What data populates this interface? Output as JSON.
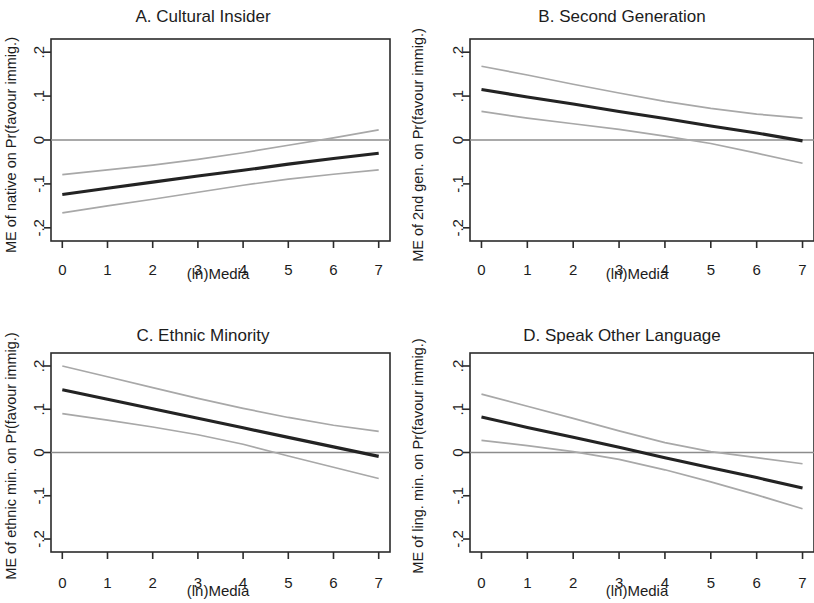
{
  "figure": {
    "background_color": "#ffffff",
    "me_line_color": "#232323",
    "ci_line_color": "#a8a8a8",
    "zero_line_color": "#8c8c8c",
    "axis_color": "#2b2b2b"
  },
  "panels": {
    "a": {
      "title": "A. Cultural Insider",
      "xlabel": "(ln)Media",
      "ylabel": "ME of native on Pr(favour immig.)",
      "xticks": [
        "0",
        "1",
        "2",
        "3",
        "4",
        "5",
        "6",
        "7"
      ],
      "yticks": [
        "-.2",
        "-.1",
        "0",
        ".1",
        ".2"
      ]
    },
    "b": {
      "title": "B. Second Generation",
      "xlabel": "(ln)Media",
      "ylabel": "ME of 2nd gen. on Pr(favour immig.)",
      "xticks": [
        "0",
        "1",
        "2",
        "3",
        "4",
        "5",
        "6",
        "7"
      ],
      "yticks": [
        "-.2",
        "-.1",
        "0",
        ".1",
        ".2"
      ]
    },
    "c": {
      "title": "C. Ethnic Minority",
      "xlabel": "(ln)Media",
      "ylabel": "ME of ethnic min. on Pr(favour immig.)",
      "xticks": [
        "0",
        "1",
        "2",
        "3",
        "4",
        "5",
        "6",
        "7"
      ],
      "yticks": [
        "-.2",
        "-.1",
        "0",
        ".1",
        ".2"
      ]
    },
    "d": {
      "title": "D. Speak Other Language",
      "xlabel": "(ln)Media",
      "ylabel": "ME of ling. min. on Pr(favour immig.)",
      "xticks": [
        "0",
        "1",
        "2",
        "3",
        "4",
        "5",
        "6",
        "7"
      ],
      "yticks": [
        "-.2",
        "-.1",
        "0",
        ".1",
        ".2"
      ]
    }
  },
  "chart_data": [
    {
      "id": "a",
      "type": "line",
      "title": "A. Cultural Insider",
      "xlabel": "(ln)Media",
      "ylabel": "ME of native on Pr(favour immig.)",
      "xlim": [
        -0.25,
        7.25
      ],
      "ylim": [
        -0.23,
        0.23
      ],
      "xticks": [
        0,
        1,
        2,
        3,
        4,
        5,
        6,
        7
      ],
      "yticks": [
        -0.2,
        -0.1,
        0,
        0.1,
        0.2
      ],
      "grid": false,
      "legend": "none",
      "reference_line_y": 0,
      "x": [
        0,
        1,
        2,
        3,
        4,
        5,
        6,
        7
      ],
      "series": [
        {
          "name": "Marginal effect",
          "style": "solid-dark",
          "values": [
            -0.124,
            -0.11,
            -0.096,
            -0.082,
            -0.069,
            -0.055,
            -0.042,
            -0.03
          ]
        },
        {
          "name": "95% CI upper",
          "style": "thin-grey",
          "values": [
            -0.079,
            -0.068,
            -0.057,
            -0.044,
            -0.029,
            -0.012,
            0.005,
            0.023
          ]
        },
        {
          "name": "95% CI lower",
          "style": "thin-grey",
          "values": [
            -0.166,
            -0.15,
            -0.135,
            -0.119,
            -0.103,
            -0.089,
            -0.078,
            -0.068
          ]
        }
      ]
    },
    {
      "id": "b",
      "type": "line",
      "title": "B. Second Generation",
      "xlabel": "(ln)Media",
      "ylabel": "ME of 2nd gen. on Pr(favour immig.)",
      "xlim": [
        -0.25,
        7.25
      ],
      "ylim": [
        -0.23,
        0.23
      ],
      "xticks": [
        0,
        1,
        2,
        3,
        4,
        5,
        6,
        7
      ],
      "yticks": [
        -0.2,
        -0.1,
        0,
        0.1,
        0.2
      ],
      "grid": false,
      "legend": "none",
      "reference_line_y": 0,
      "x": [
        0,
        1,
        2,
        3,
        4,
        5,
        6,
        7
      ],
      "series": [
        {
          "name": "Marginal effect",
          "style": "solid-dark",
          "values": [
            0.115,
            0.098,
            0.082,
            0.065,
            0.049,
            0.032,
            0.016,
            -0.002
          ]
        },
        {
          "name": "95% CI upper",
          "style": "thin-grey",
          "values": [
            0.168,
            0.148,
            0.127,
            0.107,
            0.088,
            0.072,
            0.059,
            0.05
          ]
        },
        {
          "name": "95% CI lower",
          "style": "thin-grey",
          "values": [
            0.065,
            0.05,
            0.037,
            0.024,
            0.009,
            -0.008,
            -0.03,
            -0.053
          ]
        }
      ]
    },
    {
      "id": "c",
      "type": "line",
      "title": "C. Ethnic Minority",
      "xlabel": "(ln)Media",
      "ylabel": "ME of ethnic min. on Pr(favour immig.)",
      "xlim": [
        -0.25,
        7.25
      ],
      "ylim": [
        -0.23,
        0.23
      ],
      "xticks": [
        0,
        1,
        2,
        3,
        4,
        5,
        6,
        7
      ],
      "yticks": [
        -0.2,
        -0.1,
        0,
        0.1,
        0.2
      ],
      "grid": false,
      "legend": "none",
      "reference_line_y": 0,
      "x": [
        0,
        1,
        2,
        3,
        4,
        5,
        6,
        7
      ],
      "series": [
        {
          "name": "Marginal effect",
          "style": "solid-dark",
          "values": [
            0.145,
            0.123,
            0.101,
            0.079,
            0.057,
            0.035,
            0.013,
            -0.009
          ]
        },
        {
          "name": "95% CI upper",
          "style": "thin-grey",
          "values": [
            0.2,
            0.175,
            0.15,
            0.125,
            0.102,
            0.081,
            0.063,
            0.049
          ]
        },
        {
          "name": "95% CI lower",
          "style": "thin-grey",
          "values": [
            0.09,
            0.075,
            0.059,
            0.041,
            0.019,
            -0.008,
            -0.034,
            -0.06
          ]
        }
      ]
    },
    {
      "id": "d",
      "type": "line",
      "title": "D. Speak Other Language",
      "xlabel": "(ln)Media",
      "ylabel": "ME of ling. min. on Pr(favour immig.)",
      "xlim": [
        -0.25,
        7.25
      ],
      "ylim": [
        -0.23,
        0.23
      ],
      "xticks": [
        0,
        1,
        2,
        3,
        4,
        5,
        6,
        7
      ],
      "yticks": [
        -0.2,
        -0.1,
        0,
        0.1,
        0.2
      ],
      "grid": false,
      "legend": "none",
      "reference_line_y": 0,
      "x": [
        0,
        1,
        2,
        3,
        4,
        5,
        6,
        7
      ],
      "series": [
        {
          "name": "Marginal effect",
          "style": "solid-dark",
          "values": [
            0.082,
            0.058,
            0.035,
            0.012,
            -0.012,
            -0.035,
            -0.058,
            -0.082
          ]
        },
        {
          "name": "95% CI upper",
          "style": "thin-grey",
          "values": [
            0.135,
            0.107,
            0.079,
            0.05,
            0.023,
            0.002,
            -0.012,
            -0.026
          ]
        },
        {
          "name": "95% CI lower",
          "style": "thin-grey",
          "values": [
            0.028,
            0.016,
            0.002,
            -0.016,
            -0.04,
            -0.068,
            -0.098,
            -0.13
          ]
        }
      ]
    }
  ]
}
